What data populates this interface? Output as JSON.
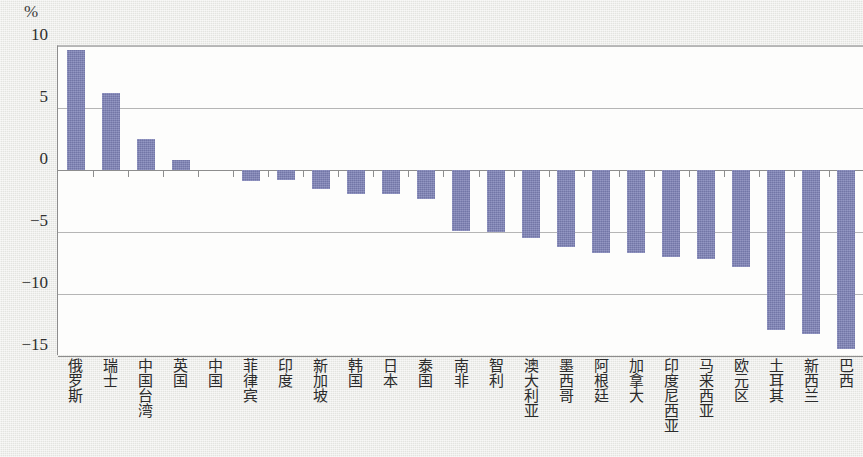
{
  "chart_data": {
    "type": "bar",
    "title": "",
    "subtitle": "",
    "xlabel": "",
    "ylabel": "",
    "unit_label": "%",
    "ylim": [
      -15,
      10
    ],
    "yticks": [
      10,
      5,
      0,
      -5,
      -10,
      -15
    ],
    "ytick_labels": [
      "10",
      "5",
      "0",
      "−5",
      "−10",
      "−15"
    ],
    "grid": true,
    "legend": null,
    "bar_color": "#7d81b6",
    "plot_background": "#fdfdfc",
    "page_background": "#e9eae6",
    "categories": [
      "俄罗斯",
      "瑞士",
      "中国台湾",
      "英国",
      "中国",
      "菲律宾",
      "印度",
      "新加坡",
      "韩国",
      "日本",
      "泰国",
      "南非",
      "智利",
      "澳大利亚",
      "墨西哥",
      "阿根廷",
      "加拿大",
      "印度尼西亚",
      "马来西亚",
      "欧元区",
      "土耳其",
      "新西兰",
      "巴西"
    ],
    "values": [
      9.7,
      6.2,
      2.5,
      0.8,
      0.0,
      -0.9,
      -0.8,
      -1.5,
      -1.9,
      -1.9,
      -2.3,
      -4.9,
      -5.0,
      -5.5,
      -6.2,
      -6.7,
      -6.7,
      -7.0,
      -7.2,
      -7.8,
      -12.9,
      -13.2,
      -14.4
    ]
  }
}
